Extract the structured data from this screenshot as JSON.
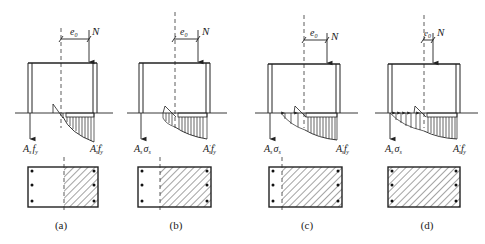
{
  "figure": {
    "colors": {
      "ink": "#222222",
      "background": "#ffffff"
    },
    "symbols": {
      "eccentricity": "e",
      "eccentricity_sub": "0",
      "axial_force": "N"
    },
    "panels": [
      {
        "id": "a",
        "label": "(a)",
        "tension_steel_label": {
          "main": "A",
          "sub": "s",
          "stress": "f",
          "stress_sub": "y"
        },
        "compression_steel_label": {
          "main": "A",
          "prime": "′",
          "sub": "s",
          "stress": "f",
          "stress_prime": "′",
          "stress_sub": "y"
        },
        "section_state": "partial compression zone (large eccentricity, tension steel yields)"
      },
      {
        "id": "b",
        "label": "(b)",
        "tension_steel_label": {
          "main": "A",
          "sub": "s",
          "stress": "σ",
          "stress_sub": "s"
        },
        "compression_steel_label": {
          "main": "A",
          "prime": "′",
          "sub": "s",
          "stress": "f",
          "stress_prime": "′",
          "stress_sub": "y"
        },
        "section_state": "larger compression zone, tension steel below yield"
      },
      {
        "id": "c",
        "label": "(c)",
        "tension_steel_label": {
          "main": "A",
          "sub": "s",
          "stress": "σ",
          "stress_sub": "s"
        },
        "compression_steel_label": {
          "main": "A",
          "prime": "′",
          "sub": "s",
          "stress": "f",
          "stress_prime": "′",
          "stress_sub": "y"
        },
        "section_state": "nearly full compression, small tension region"
      },
      {
        "id": "d",
        "label": "(d)",
        "tension_steel_label": {
          "main": "A",
          "sub": "s",
          "stress": "σ",
          "stress_sub": "s"
        },
        "compression_steel_label": {
          "main": "A",
          "prime": "′",
          "sub": "s",
          "stress": "f",
          "stress_prime": "′",
          "stress_sub": "y"
        },
        "section_state": "full section in compression (small eccentricity)"
      }
    ]
  }
}
